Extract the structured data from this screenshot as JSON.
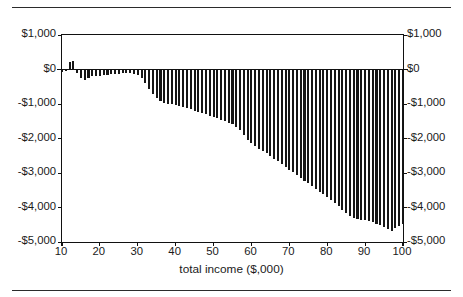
{
  "figure": {
    "background": "#ffffff",
    "bar_color": "#161616",
    "axis_color": "#111111",
    "top_rule": "",
    "bottom_rule": ""
  },
  "axis_title": "total income ($,000)",
  "chart_data": {
    "type": "bar",
    "title": "",
    "subtitle": "",
    "xlabel": "total income ($,000)",
    "ylabel": "",
    "ylabel_right": "",
    "xlim": [
      10,
      100
    ],
    "ylim": [
      -5000,
      1000
    ],
    "grid": false,
    "legend": null,
    "y_ticks": [
      1000,
      0,
      -1000,
      -2000,
      -3000,
      -4000,
      -5000
    ],
    "y_tick_labels_left": [
      "$1,000",
      "$0",
      "-$1,000",
      "-$2,000",
      "-$3,000",
      "-$4,000",
      "-$5,000"
    ],
    "y_tick_labels_right": [
      "$1,000",
      "$0",
      "-$1,000",
      "-$2,000",
      "-$3,000",
      "-$4,000",
      "-$5,000"
    ],
    "x_ticks": [
      10,
      20,
      30,
      40,
      50,
      60,
      70,
      80,
      90,
      100
    ],
    "x_tick_labels": [
      "10",
      "20",
      "30",
      "40",
      "50",
      "60",
      "70",
      "80",
      "90",
      "100"
    ],
    "bar_width_units": 0.55,
    "x": [
      10,
      11,
      12,
      13,
      14,
      15,
      16,
      17,
      18,
      19,
      20,
      21,
      22,
      23,
      24,
      25,
      26,
      27,
      28,
      29,
      30,
      31,
      32,
      33,
      34,
      35,
      36,
      37,
      38,
      39,
      40,
      41,
      42,
      43,
      44,
      45,
      46,
      47,
      48,
      49,
      50,
      51,
      52,
      53,
      54,
      55,
      56,
      57,
      58,
      59,
      60,
      61,
      62,
      63,
      64,
      65,
      66,
      67,
      68,
      69,
      70,
      71,
      72,
      73,
      74,
      75,
      76,
      77,
      78,
      79,
      80,
      81,
      82,
      83,
      84,
      85,
      86,
      87,
      88,
      89,
      90,
      91,
      92,
      93,
      94,
      95,
      96,
      97,
      98,
      99,
      100
    ],
    "values": [
      -60,
      -40,
      230,
      250,
      -100,
      -250,
      -290,
      -240,
      -200,
      -190,
      -175,
      -165,
      -150,
      -140,
      -130,
      -120,
      -110,
      -105,
      -110,
      -130,
      -170,
      -260,
      -400,
      -560,
      -720,
      -830,
      -900,
      -960,
      -990,
      -1010,
      -1030,
      -1060,
      -1090,
      -1120,
      -1150,
      -1190,
      -1230,
      -1260,
      -1300,
      -1340,
      -1380,
      -1420,
      -1460,
      -1500,
      -1540,
      -1590,
      -1660,
      -1760,
      -1900,
      -2030,
      -2140,
      -2220,
      -2290,
      -2360,
      -2430,
      -2500,
      -2580,
      -2660,
      -2740,
      -2820,
      -2900,
      -2980,
      -3060,
      -3140,
      -3220,
      -3300,
      -3380,
      -3460,
      -3540,
      -3620,
      -3700,
      -3790,
      -3880,
      -3970,
      -4060,
      -4150,
      -4240,
      -4300,
      -4330,
      -4350,
      -4370,
      -4400,
      -4430,
      -4470,
      -4510,
      -4560,
      -4620,
      -4680,
      -4600,
      -4530,
      -4480
    ]
  }
}
